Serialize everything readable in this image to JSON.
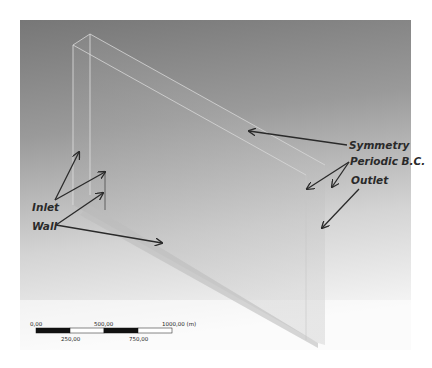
{
  "figure": {
    "background_top": "#7a7a7a",
    "background_bottom": "#ffffff",
    "edge_color": "#d8d8d8"
  },
  "labels": {
    "symmetry": "Symmetry",
    "periodic": "Periodic B.C.",
    "outlet": "Outlet",
    "inlet": "Inlet",
    "wall": "Wall"
  },
  "scale_bar": {
    "tick_0": "0,00",
    "tick_250": "250,00",
    "tick_500": "500,00",
    "tick_750": "750,00",
    "tick_1000": "1000,00 (m)"
  }
}
